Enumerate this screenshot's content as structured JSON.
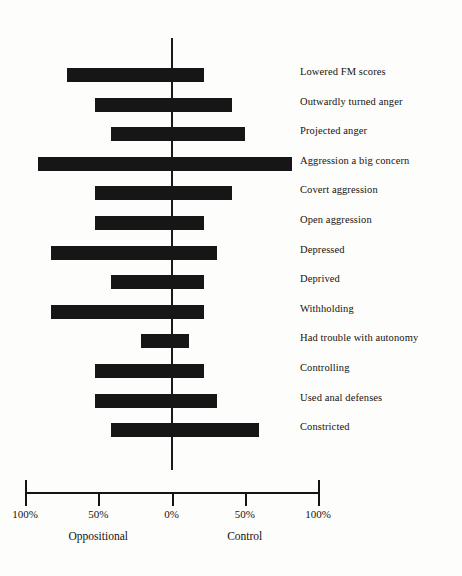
{
  "chart_data": {
    "type": "bar",
    "orientation": "horizontal-diverging",
    "title": "",
    "subtitle": "",
    "xlabel": "",
    "ylabel": "",
    "grid": false,
    "legend": "none",
    "xlim": [
      -100,
      100
    ],
    "axis_ticks": [
      {
        "label": "100%",
        "value": -100
      },
      {
        "label": "50%",
        "value": -50
      },
      {
        "label": "0%",
        "value": 0
      },
      {
        "label": "50%",
        "value": 50
      },
      {
        "label": "100%",
        "value": 100
      }
    ],
    "group_labels": [
      {
        "label": "Oppositional",
        "value": -50
      },
      {
        "label": "Control",
        "value": 50
      }
    ],
    "categories": [
      "Lowered FM scores",
      "Outwardly turned anger",
      "Projected anger",
      "Aggression a big concern",
      "Covert aggression",
      "Open aggression",
      "Depressed",
      "Deprived",
      "Withholding",
      "Had trouble with autonomy",
      "Controlling",
      "Used anal defenses",
      "Constricted"
    ],
    "series": [
      {
        "name": "Oppositional",
        "direction": "left",
        "values": [
          71,
          52,
          41,
          91,
          52,
          52,
          82,
          41,
          82,
          21,
          52,
          52,
          41
        ]
      },
      {
        "name": "Control",
        "direction": "right",
        "values": [
          22,
          41,
          50,
          82,
          41,
          22,
          31,
          22,
          22,
          12,
          22,
          31,
          60
        ]
      }
    ],
    "bar_color": "#161616"
  },
  "axis": {
    "tick_labels": [
      "100%",
      "50%",
      "0%",
      "50%",
      "100%"
    ],
    "left_group": "Oppositional",
    "right_group": "Control"
  },
  "labels": {
    "row0": "Lowered FM scores",
    "row1": "Outwardly turned anger",
    "row2": "Projected anger",
    "row3": "Aggression a big concern",
    "row4": "Covert aggression",
    "row5": "Open aggression",
    "row6": "Depressed",
    "row7": "Deprived",
    "row8": "Withholding",
    "row9": "Had trouble with autonomy",
    "row10": "Controlling",
    "row11": "Used anal defenses",
    "row12": "Constricted"
  }
}
